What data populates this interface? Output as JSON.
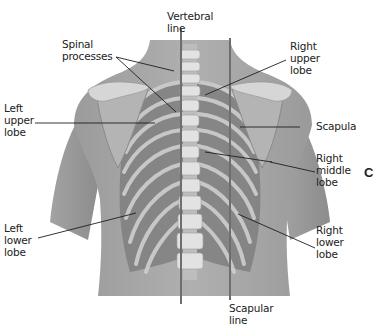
{
  "figure": {
    "panel_letter": "C",
    "colors": {
      "background": "#ffffff",
      "skin": "#a9a9a9",
      "skin_dark": "#8f8f8f",
      "lung": "#7d7d7d",
      "bone": "#d9d9d9",
      "reference_line": "#6e6e6e",
      "leader_line": "#1e1e1e",
      "text": "#222222"
    }
  },
  "labels": {
    "vertebral_line": "Vertebral\nline",
    "spinal_processes": "Spinal\nprocesses",
    "right_upper_lobe": "Right\nupper\nlobe",
    "left_upper_lobe": "Left\nupper\nlobe",
    "scapula": "Scapula",
    "right_middle_lobe": "Right\nmiddle\nlobe",
    "left_lower_lobe": "Left\nlower\nlobe",
    "right_lower_lobe": "Right\nlower\nlobe",
    "scapular_line": "Scapular\nline"
  }
}
